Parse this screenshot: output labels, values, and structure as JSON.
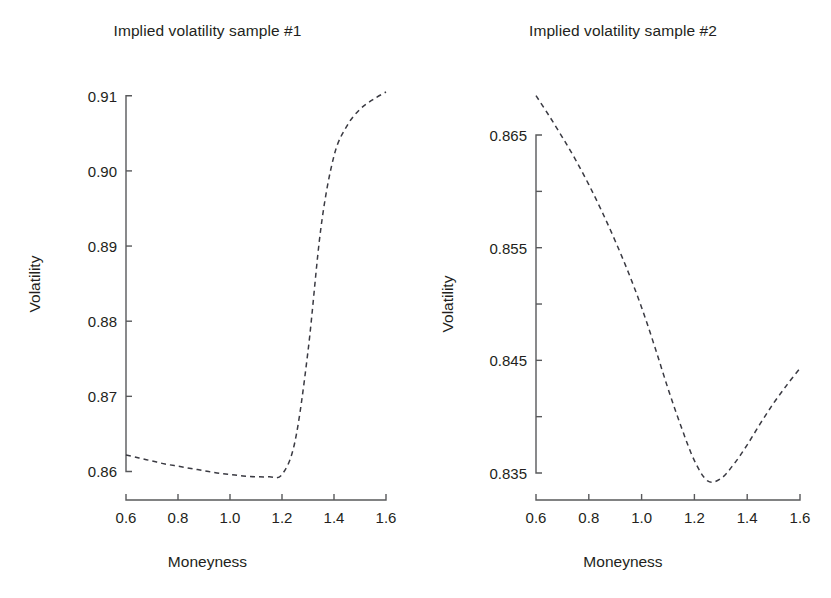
{
  "figure": {
    "background_color": "#ffffff",
    "line_color": "#3a3a42",
    "axis_color": "#58595b",
    "text_color": "#231f20"
  },
  "chart_data": [
    {
      "type": "line",
      "panel": "left",
      "title": "Implied volatility sample #1",
      "xlabel": "Moneyness",
      "ylabel": "Volatility",
      "grid": false,
      "legend": "none",
      "line_style": "dashed",
      "xlim": [
        0.6,
        1.6
      ],
      "ylim": [
        0.859,
        0.9105
      ],
      "xticks": [
        0.6,
        0.8,
        1.0,
        1.2,
        1.4,
        1.6
      ],
      "xtick_labels": [
        "0.6",
        "0.8",
        "1.0",
        "1.2",
        "1.4",
        "1.6"
      ],
      "yticks": [
        0.86,
        0.87,
        0.88,
        0.89,
        0.9,
        0.91
      ],
      "ytick_labels": [
        "0.86",
        "0.87",
        "0.88",
        "0.89",
        "0.90",
        "0.91"
      ],
      "x": [
        0.6,
        0.65,
        0.7,
        0.75,
        0.8,
        0.85,
        0.9,
        0.95,
        1.0,
        1.05,
        1.1,
        1.15,
        1.2,
        1.25,
        1.3,
        1.35,
        1.4,
        1.45,
        1.5,
        1.55,
        1.6
      ],
      "y": [
        0.8622,
        0.8618,
        0.8614,
        0.861,
        0.8607,
        0.8604,
        0.8601,
        0.8598,
        0.8596,
        0.8594,
        0.8593,
        0.8593,
        0.8596,
        0.864,
        0.876,
        0.8925,
        0.902,
        0.906,
        0.9082,
        0.9095,
        0.9105
      ]
    },
    {
      "type": "line",
      "panel": "right",
      "title": "Implied volatility sample #2",
      "xlabel": "Moneyness",
      "ylabel": "Volatility",
      "grid": false,
      "legend": "none",
      "line_style": "dashed",
      "xlim": [
        0.6,
        1.6
      ],
      "ylim": [
        0.8342,
        0.869
      ],
      "xticks": [
        0.6,
        0.8,
        1.0,
        1.2,
        1.4,
        1.6
      ],
      "xtick_labels": [
        "0.6",
        "0.8",
        "1.0",
        "1.2",
        "1.4",
        "1.6"
      ],
      "yticks": [
        0.835,
        0.84,
        0.845,
        0.85,
        0.855,
        0.86,
        0.865
      ],
      "ytick_labels": [
        "0.835",
        "",
        "0.845",
        "",
        "0.855",
        "",
        "0.865"
      ],
      "x": [
        0.6,
        0.65,
        0.7,
        0.75,
        0.8,
        0.85,
        0.9,
        0.95,
        1.0,
        1.05,
        1.1,
        1.15,
        1.2,
        1.25,
        1.3,
        1.35,
        1.4,
        1.45,
        1.5,
        1.55,
        1.6
      ],
      "y": [
        0.8685,
        0.8667,
        0.8648,
        0.8628,
        0.8606,
        0.8582,
        0.8556,
        0.8528,
        0.8497,
        0.8462,
        0.8425,
        0.8391,
        0.8361,
        0.8343,
        0.8345,
        0.8358,
        0.8375,
        0.8394,
        0.8412,
        0.8428,
        0.8443
      ]
    }
  ]
}
